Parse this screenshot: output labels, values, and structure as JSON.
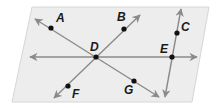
{
  "diagram": {
    "plane": {
      "points": [
        [
          32,
          7
        ],
        [
          209,
          7
        ],
        [
          192,
          102
        ],
        [
          12,
          102
        ]
      ],
      "fill": "#ededed",
      "stroke": "#d6d6d6"
    },
    "line_color": "#8a8a8a",
    "point_color": "#111111",
    "lines": [
      {
        "name": "line-horizontal",
        "from": [
          30,
          57
        ],
        "to": [
          197,
          57
        ]
      },
      {
        "name": "line-AG",
        "from": [
          35,
          19
        ],
        "to": [
          159,
          97
        ]
      },
      {
        "name": "line-BF",
        "from": [
          140,
          15
        ],
        "to": [
          54,
          98
        ]
      },
      {
        "name": "line-CE",
        "from": [
          181,
          9
        ],
        "to": [
          165,
          97
        ]
      }
    ],
    "points": [
      {
        "id": "A",
        "label": "A",
        "x": 51,
        "y": 28,
        "lx": 56,
        "ly": 22
      },
      {
        "id": "B",
        "label": "B",
        "x": 124,
        "y": 29,
        "lx": 117,
        "ly": 21
      },
      {
        "id": "C",
        "label": "C",
        "x": 177,
        "y": 33,
        "lx": 181,
        "ly": 31
      },
      {
        "id": "D",
        "label": "D",
        "x": 96,
        "y": 57,
        "lx": 90,
        "ly": 51
      },
      {
        "id": "E",
        "label": "E",
        "x": 172,
        "y": 57,
        "lx": 160,
        "ly": 53
      },
      {
        "id": "F",
        "label": "F",
        "x": 68,
        "y": 86,
        "lx": 72,
        "ly": 98
      },
      {
        "id": "G",
        "label": "G",
        "x": 134,
        "y": 81,
        "lx": 124,
        "ly": 94
      }
    ]
  }
}
